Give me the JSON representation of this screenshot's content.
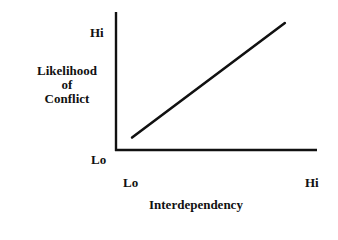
{
  "chart_data": {
    "type": "line",
    "title": "",
    "xlabel": "Interdependency",
    "ylabel": "Likelihood of Conflict",
    "ylabel_lines": [
      "Likelihood",
      "of",
      "Conflict"
    ],
    "x_ticks": [
      "Lo",
      "Hi"
    ],
    "y_ticks": [
      "Lo",
      "Hi"
    ],
    "xlim": [
      0,
      1
    ],
    "ylim": [
      0,
      1
    ],
    "grid": false,
    "legend": null,
    "series": [
      {
        "name": "Likelihood of Conflict",
        "x": [
          0.08,
          0.84
        ],
        "y": [
          0.09,
          0.92
        ]
      }
    ]
  },
  "axes": {
    "y_hi": "Hi",
    "y_lo": "Lo",
    "x_lo": "Lo",
    "x_hi": "Hi"
  },
  "colors": {
    "line": "#111111",
    "axis": "#111111",
    "background": "#ffffff"
  }
}
